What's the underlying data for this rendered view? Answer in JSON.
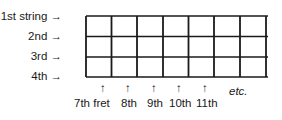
{
  "diagram": {
    "type": "guitar-fretboard-grid",
    "strings": [
      {
        "label": "1st string",
        "arrow": "→"
      },
      {
        "label": "2nd",
        "arrow": "→"
      },
      {
        "label": "3rd",
        "arrow": "→"
      },
      {
        "label": "4th",
        "arrow": "→"
      }
    ],
    "frets": [
      {
        "label": "7th fret",
        "arrow": "↑"
      },
      {
        "label": "8th",
        "arrow": "↑"
      },
      {
        "label": "9th",
        "arrow": "↑"
      },
      {
        "label": "10th",
        "arrow": "↑"
      },
      {
        "label": "11th",
        "arrow": "↑"
      }
    ],
    "continuation": "etc.",
    "line_color": "#1a1a1a"
  }
}
